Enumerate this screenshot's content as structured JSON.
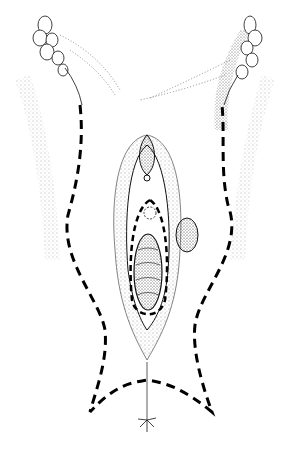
{
  "figure": {
    "kind": "surgical line illustration",
    "style": "black ink stipple on white",
    "colors": {
      "ink": "#111111",
      "background": "#ffffff"
    },
    "elements": [
      "left-thigh-crease",
      "right-thigh-crease",
      "left-lymph-nodes",
      "right-lymph-nodes",
      "vulva",
      "central-lesion",
      "side-lesion",
      "inner-incision-dashed",
      "outer-incision-dashed",
      "anal-mark"
    ]
  }
}
